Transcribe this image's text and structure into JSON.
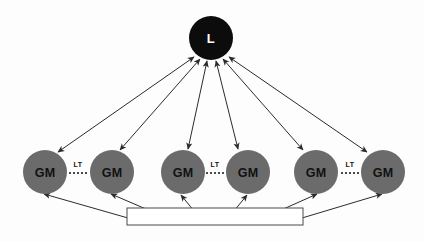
{
  "diagram": {
    "type": "node-link",
    "background_color": "#fdfdfd",
    "leader_node": {
      "label": "L",
      "fill_color": "#0c0c0c",
      "text_color": "#ffffff",
      "cx": 211,
      "cy": 38,
      "r": 22
    },
    "gm_nodes": [
      {
        "label": "GM",
        "cx": 45,
        "cy": 172,
        "r": 22
      },
      {
        "label": "GM",
        "cx": 112,
        "cy": 172,
        "r": 22
      },
      {
        "label": "GM",
        "cx": 183,
        "cy": 172,
        "r": 22
      },
      {
        "label": "GM",
        "cx": 248,
        "cy": 172,
        "r": 22
      },
      {
        "label": "GM",
        "cx": 316,
        "cy": 172,
        "r": 22
      },
      {
        "label": "GM",
        "cx": 383,
        "cy": 172,
        "r": 22
      }
    ],
    "gm_node_style": {
      "fill_color": "#6b6b6b",
      "text_color": "#111111"
    },
    "lt_links": [
      {
        "label": "LT",
        "x": 78,
        "y": 164,
        "x1": 69,
        "x2": 89,
        "line_y": 173
      },
      {
        "label": "LT",
        "x": 215,
        "y": 164,
        "x1": 206,
        "x2": 226,
        "line_y": 173
      },
      {
        "label": "LT",
        "x": 350,
        "y": 164,
        "x1": 341,
        "x2": 360,
        "line_y": 173
      }
    ],
    "bus_rectangle": {
      "x": 127,
      "y": 208,
      "width": 176,
      "height": 17,
      "fill_color": "#ffffff",
      "stroke_color": "#4a4a4a"
    },
    "leader_edges": [
      {
        "from": "leader",
        "to": "gm-1",
        "arrowheads": "both",
        "x1": 194,
        "y1": 57,
        "x2": 58,
        "y2": 152
      },
      {
        "from": "leader",
        "to": "gm-2",
        "arrowheads": "both",
        "x1": 200,
        "y1": 59,
        "x2": 120,
        "y2": 150
      },
      {
        "from": "leader",
        "to": "gm-3",
        "arrowheads": "both",
        "x1": 207,
        "y1": 61,
        "x2": 188,
        "y2": 149
      },
      {
        "from": "leader",
        "to": "gm-4",
        "arrowheads": "both",
        "x1": 216,
        "y1": 61,
        "x2": 238,
        "y2": 149
      },
      {
        "from": "leader",
        "to": "gm-5",
        "arrowheads": "both",
        "x1": 223,
        "y1": 59,
        "x2": 303,
        "y2": 150
      },
      {
        "from": "leader",
        "to": "gm-6",
        "arrowheads": "both",
        "x1": 229,
        "y1": 57,
        "x2": 367,
        "y2": 152
      }
    ],
    "bus_edges": [
      {
        "from": "bus",
        "to": "gm-1",
        "arrowheads": "end",
        "x1": 128,
        "y1": 218,
        "x2": 44,
        "y2": 194
      },
      {
        "from": "bus",
        "to": "gm-2",
        "arrowheads": "end",
        "x1": 160,
        "y1": 215,
        "x2": 111,
        "y2": 194
      },
      {
        "from": "bus",
        "to": "gm-3",
        "arrowheads": "end",
        "x1": 194,
        "y1": 211,
        "x2": 181,
        "y2": 195
      },
      {
        "from": "bus",
        "to": "gm-4",
        "arrowheads": "end",
        "x1": 234,
        "y1": 211,
        "x2": 247,
        "y2": 195
      },
      {
        "from": "bus",
        "to": "gm-5",
        "arrowheads": "end",
        "x1": 270,
        "y1": 215,
        "x2": 317,
        "y2": 194
      },
      {
        "from": "bus",
        "to": "gm-6",
        "arrowheads": "end",
        "x1": 302,
        "y1": 218,
        "x2": 382,
        "y2": 194
      }
    ],
    "edge_style": {
      "stroke_color": "#2b2b2b",
      "stroke_width": 1
    }
  }
}
